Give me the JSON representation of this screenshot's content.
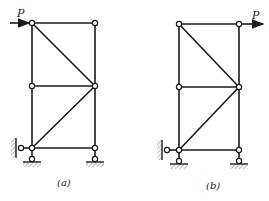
{
  "figures": [
    {
      "id": "a",
      "caption": "(a)",
      "load_label": "P",
      "load_position": "top-left joint, pointing right (arrow approaches from left)",
      "supports": [
        "horizontal pin to wall at bottom-left",
        "vertical pin support at bottom-left",
        "vertical pin support at bottom-right"
      ]
    },
    {
      "id": "b",
      "caption": "(b)",
      "load_label": "P",
      "load_position": "top-right joint, pointing right (arrow leaves to right)",
      "supports": [
        "horizontal pin to wall at bottom-left",
        "vertical pin support at bottom-left",
        "vertical pin support at bottom-right"
      ]
    }
  ],
  "colors": {
    "line": "#1a1a1a",
    "background": "#ffffff"
  }
}
